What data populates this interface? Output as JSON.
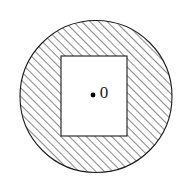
{
  "figure": {
    "name": "hatched-disc-with-rectangular-hole",
    "background_color": "#ffffff",
    "canvas": {
      "width": 188,
      "height": 193
    },
    "outer_circle": {
      "name": "outer-circle",
      "shape": "circle",
      "center_x": 96,
      "center_y": 96.5,
      "radius": 76,
      "stroke_color": "#1a1a1a",
      "stroke_width": 1,
      "fill": "hatch"
    },
    "inner_rectangle": {
      "name": "inner-rectangle",
      "shape": "rectangle",
      "x": 61,
      "y": 56,
      "width": 66,
      "height": 80,
      "stroke_color": "#1a1a1a",
      "stroke_width": 1,
      "fill_color": "#ffffff"
    },
    "hatch": {
      "name": "diagonal-hatch-pattern",
      "angle_deg": 45,
      "direction": "lower-left-to-upper-right",
      "spacing_px": 6,
      "line_width": 1,
      "line_color": "#1a1a1a"
    },
    "center_point": {
      "name": "center-point-marker",
      "x": 93,
      "y": 95,
      "radius": 2.4,
      "fill_color": "#000000"
    },
    "center_label": {
      "name": "center-point-label",
      "text": "0",
      "x": 104,
      "y": 94,
      "font_size_px": 17,
      "color": "#1a1a1a"
    }
  }
}
